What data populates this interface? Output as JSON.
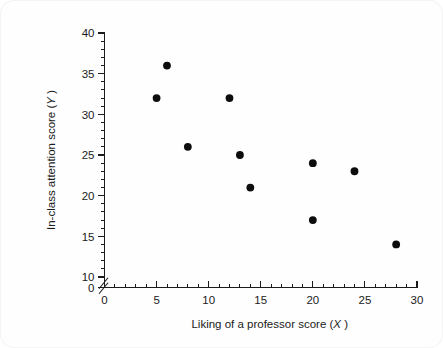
{
  "chart_data": {
    "type": "scatter",
    "title": "",
    "xlabel": "Liking of a professor score (X)",
    "ylabel": "In-class attention score (Y)",
    "xlabel_text": "Liking of a professor score",
    "xlabel_var": "X",
    "ylabel_text": "In-class attention score",
    "ylabel_var": "Y",
    "xlim": [
      0,
      30
    ],
    "ylim": [
      0,
      40
    ],
    "y_axis_break": true,
    "y_break_between": [
      0,
      10
    ],
    "grid": false,
    "legend": false,
    "x_ticks_major": [
      0,
      5,
      10,
      15,
      20,
      25,
      30
    ],
    "x_tick_labels": [
      "0",
      "5",
      "10",
      "15",
      "20",
      "25",
      "30"
    ],
    "x_tick_minor_step": 1,
    "y_ticks_major": [
      0,
      10,
      15,
      20,
      25,
      30,
      35,
      40
    ],
    "y_tick_labels": [
      "0",
      "10",
      "15",
      "20",
      "25",
      "30",
      "35",
      "40"
    ],
    "y_tick_minor_step": 1,
    "marker": "filled-circle",
    "marker_color": "#0d0d0d",
    "marker_size_px": 5.2,
    "points": [
      {
        "x": 5,
        "y": 32
      },
      {
        "x": 6,
        "y": 36
      },
      {
        "x": 8,
        "y": 26
      },
      {
        "x": 12,
        "y": 32
      },
      {
        "x": 13,
        "y": 25
      },
      {
        "x": 14,
        "y": 21
      },
      {
        "x": 20,
        "y": 24
      },
      {
        "x": 20,
        "y": 17
      },
      {
        "x": 24,
        "y": 23
      },
      {
        "x": 28,
        "y": 14
      }
    ],
    "n_points": 10
  },
  "figure": {
    "background_color": "#fefefe",
    "page_background_color": "#ffffff",
    "axis_color": "#1b1b1b"
  }
}
